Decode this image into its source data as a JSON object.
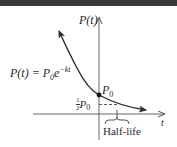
{
  "figure": {
    "y_axis_label": "P(t)",
    "x_axis_label": "t",
    "formula": {
      "lhs": "P(t) = P",
      "sub": "0",
      "base": "e",
      "exp": "−kt"
    },
    "point_label": {
      "main": "P",
      "sub": "0"
    },
    "half_label": {
      "frac_num": "1",
      "frac_den": "2",
      "main": "P",
      "sub": "0"
    },
    "bracket_label": "Half-life",
    "colors": {
      "curve": "#2a2a2a",
      "axes": "#555555",
      "band": "#3a3a3a"
    }
  }
}
